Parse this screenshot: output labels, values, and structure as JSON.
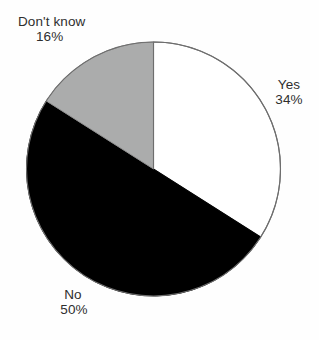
{
  "chart_data": {
    "type": "pie",
    "title": "",
    "subtitle": "",
    "xlabel": "",
    "ylabel": "",
    "grid": false,
    "legend_position": "none",
    "labels_position": "outside",
    "start_angle_deg": 0,
    "direction": "clockwise",
    "categories": [
      "Yes",
      "No",
      "Don't know"
    ],
    "values": [
      34,
      50,
      16
    ],
    "value_unit": "%",
    "slices": [
      {
        "label": "Yes",
        "value": 34,
        "value_text": "34%",
        "fill": "#ffffff",
        "stroke": "#6e6e6e",
        "start_deg": 0,
        "end_deg": 122.4
      },
      {
        "label": "No",
        "value": 50,
        "value_text": "50%",
        "fill": "#000000",
        "stroke": "#000000",
        "start_deg": 122.4,
        "end_deg": 302.4
      },
      {
        "label": "Don't know",
        "value": 16,
        "value_text": "16%",
        "fill": "#abacac",
        "stroke": "#8e8e8e",
        "start_deg": 302.4,
        "end_deg": 360
      }
    ],
    "annotations": []
  },
  "labels": {
    "yes": {
      "name": "Yes",
      "value": "34%"
    },
    "no": {
      "name": "No",
      "value": "50%"
    },
    "dontknow": {
      "name": "Don't know",
      "value": "16%"
    }
  },
  "colors": {
    "background": "#fefefe",
    "text": "#2e2e2e",
    "slice_yes": "#ffffff",
    "slice_no": "#000000",
    "slice_dontknow": "#abacac",
    "outline": "#6e6e6e"
  }
}
